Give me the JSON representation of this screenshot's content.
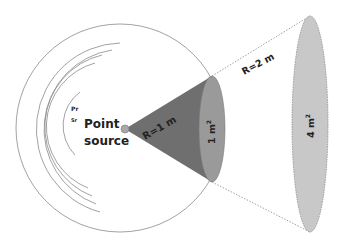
{
  "diagram": {
    "source_label_line1": "Point",
    "source_label_line2": "source",
    "small_labels": [
      "Pr",
      "Sr"
    ],
    "r1_label": "R=1 m",
    "r2_label": "R=2 m",
    "area1_label": "1 m",
    "area1_sup": "2",
    "area2_label": "4 m",
    "area2_sup": "2",
    "colors": {
      "cone": "#6f6f6f",
      "ellipse_small": "#9a9a9a",
      "ellipse_large": "#c8c8c8",
      "source_dot": "#a8a8a8",
      "arcs": "#8a8a8a",
      "dotted": "#8a8a8a"
    }
  }
}
